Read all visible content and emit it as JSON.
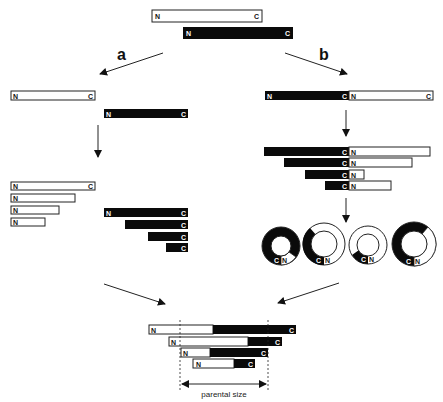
{
  "colors": {
    "black_segment": "#0a0a0a",
    "white_segment": "#ffffff",
    "stroke": "#222222"
  },
  "labels": {
    "n": "N",
    "c": "C",
    "branch_a": "a",
    "branch_b": "b",
    "parental_size": "parental size"
  },
  "parent": {
    "white_protein": {
      "left_label": "N",
      "right_label": "C"
    },
    "black_protein": {
      "left_label": "N",
      "right_label": "C"
    }
  },
  "path_a": {
    "description": "Separate N- and C-terminal truncations",
    "parents": [
      "N-C white",
      "N-C black"
    ],
    "white_truncations": [
      "N...C",
      "N",
      "N",
      "N"
    ],
    "black_truncations": [
      "N...C",
      "C",
      "C",
      "C"
    ]
  },
  "path_b": {
    "description": "Tandem fusion, circular permutation",
    "fusion": [
      "N (black)",
      "C|N",
      "C (white)"
    ],
    "truncations": [
      "C N",
      "C N",
      "C N",
      "C N"
    ],
    "circles": [
      "C N",
      "C N",
      "C N",
      "C N"
    ]
  },
  "result": {
    "rows": [
      "N ... C",
      "N ... C",
      "N ... C",
      "N ... C"
    ],
    "dimension_label": "parental size"
  }
}
